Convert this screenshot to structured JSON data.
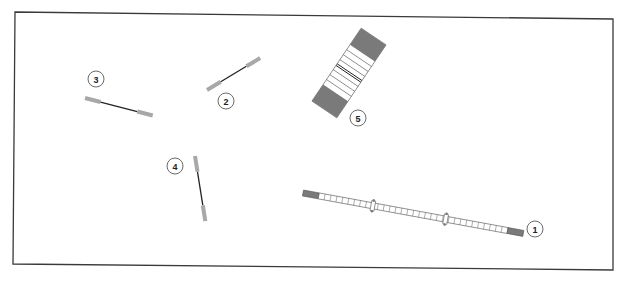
{
  "diagram": {
    "type": "equipment layout",
    "frame": {
      "stroke": "#3a3a3a"
    },
    "colors": {
      "grip": "#a8a8a8",
      "bar": "#222222",
      "end_cap": "#7a7a7a",
      "segment_fill": "#ffffff",
      "segment_stroke": "#555555"
    },
    "items": [
      {
        "id": "1",
        "label": "1",
        "description": "long segmented bar with dark end caps and two collars"
      },
      {
        "id": "2",
        "label": "2",
        "description": "short bar with light grey grips"
      },
      {
        "id": "3",
        "label": "3",
        "description": "short bar with light grey grips"
      },
      {
        "id": "4",
        "label": "4",
        "description": "short bar with light grey grips, near vertical"
      },
      {
        "id": "5",
        "label": "5",
        "description": "wide striped mat with dark end blocks"
      }
    ]
  }
}
